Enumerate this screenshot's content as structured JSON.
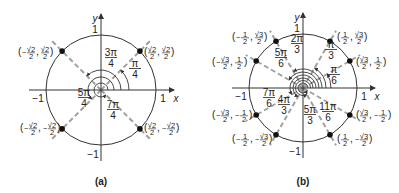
{
  "diagrams": [
    {
      "caption": "(a)",
      "center": [
        101,
        90
      ],
      "radius": 55,
      "axis_labels": {
        "x": "x",
        "y": "y"
      },
      "ticks": {
        "pos_x": "1",
        "neg_x": "−1",
        "pos_y": "1",
        "neg_y": "−1"
      },
      "points": [
        {
          "label": "(√2/2, √2/2)",
          "x_num": "√2",
          "x_den": "2",
          "x_neg": false,
          "y_num": "√2",
          "y_den": "2",
          "y_neg": false,
          "angle_deg": 45
        },
        {
          "label": "(−√2/2, √2/2)",
          "x_num": "√2",
          "x_den": "2",
          "x_neg": true,
          "y_num": "√2",
          "y_den": "2",
          "y_neg": false,
          "angle_deg": 135
        },
        {
          "label": "(−√2/2, −√2/2)",
          "x_num": "√2",
          "x_den": "2",
          "x_neg": true,
          "y_num": "√2",
          "y_den": "2",
          "y_neg": true,
          "angle_deg": 225
        },
        {
          "label": "(√2/2, −√2/2)",
          "x_num": "√2",
          "x_den": "2",
          "x_neg": false,
          "y_num": "√2",
          "y_den": "2",
          "y_neg": true,
          "angle_deg": 315
        }
      ],
      "angles": [
        {
          "num": "π",
          "den": "4",
          "deg": 45
        },
        {
          "num": "3π",
          "den": "4",
          "deg": 135
        },
        {
          "num": "5π",
          "den": "4",
          "deg": 225
        },
        {
          "num": "7π",
          "den": "4",
          "deg": 315
        }
      ]
    },
    {
      "caption": "(b)",
      "center": [
        303,
        88
      ],
      "radius": 54,
      "axis_labels": {
        "x": "x",
        "y": "y"
      },
      "ticks": {
        "pos_x": "1",
        "neg_x": "−1",
        "pos_y": "1",
        "neg_y": "−1"
      },
      "points": [
        {
          "label": "(√3/2, 1/2)",
          "angle_deg": 30
        },
        {
          "label": "(1/2, √3/2)",
          "angle_deg": 60
        },
        {
          "label": "(−1/2, √3/2)",
          "angle_deg": 120
        },
        {
          "label": "(−√3/2, 1/2)",
          "angle_deg": 150
        },
        {
          "label": "(−√3/2, −1/2)",
          "angle_deg": 210
        },
        {
          "label": "(−1/2, −√3/2)",
          "angle_deg": 240
        },
        {
          "label": "(1/2, −√3/2)",
          "angle_deg": 300
        },
        {
          "label": "(√3/2, −1/2)",
          "angle_deg": 330
        }
      ],
      "angles": [
        {
          "num": "π",
          "den": "6",
          "deg": 30
        },
        {
          "num": "π",
          "den": "3",
          "deg": 60
        },
        {
          "num": "2π",
          "den": "3",
          "deg": 120
        },
        {
          "num": "5π",
          "den": "6",
          "deg": 150
        },
        {
          "num": "7π",
          "den": "6",
          "deg": 210
        },
        {
          "num": "4π",
          "den": "3",
          "deg": 240
        },
        {
          "num": "5π",
          "den": "3",
          "deg": 300
        },
        {
          "num": "11π",
          "den": "6",
          "deg": 330
        }
      ]
    }
  ]
}
